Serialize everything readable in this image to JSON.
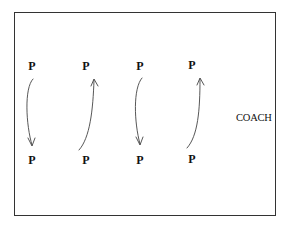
{
  "diagram": {
    "players": {
      "top": [
        {
          "label": "P",
          "x": 32,
          "y": 66
        },
        {
          "label": "P",
          "x": 86,
          "y": 66
        },
        {
          "label": "P",
          "x": 140,
          "y": 66
        },
        {
          "label": "P",
          "x": 192,
          "y": 65
        }
      ],
      "bottom": [
        {
          "label": "P",
          "x": 32,
          "y": 160
        },
        {
          "label": "P",
          "x": 86,
          "y": 160
        },
        {
          "label": "P",
          "x": 140,
          "y": 160
        },
        {
          "label": "P",
          "x": 192,
          "y": 159
        }
      ]
    },
    "coach_label": "COACH",
    "arrows": [
      {
        "from": "top-1",
        "to": "bottom-1",
        "direction": "down"
      },
      {
        "from": "bottom-2",
        "to": "top-2",
        "direction": "up"
      },
      {
        "from": "top-3",
        "to": "bottom-3",
        "direction": "down"
      },
      {
        "from": "bottom-4",
        "to": "top-4",
        "direction": "up"
      }
    ],
    "colors": {
      "frame": "#333333",
      "text": "#111111",
      "arrow": "#444444"
    }
  }
}
